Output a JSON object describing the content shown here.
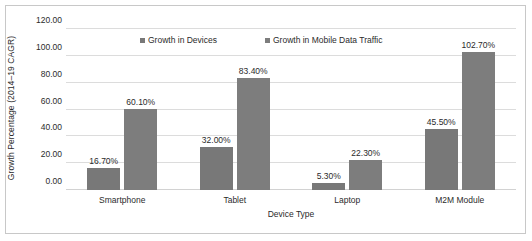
{
  "chart_data": {
    "type": "bar",
    "title": "",
    "xlabel": "Device Type",
    "ylabel": "Growth Percentage (2014–19 CAGR)",
    "categories": [
      "Smartphone",
      "Tablet",
      "Laptop",
      "M2M Module"
    ],
    "series": [
      {
        "name": "Growth in Devices",
        "color": "#787878",
        "values": [
          16.7,
          32.0,
          5.3,
          45.5
        ],
        "labels": [
          "16.70%",
          "32.00%",
          "5.30%",
          "45.50%"
        ]
      },
      {
        "name": "Growth in Mobile Data Traffic",
        "color": "#7d7d7d",
        "values": [
          60.1,
          83.4,
          22.3,
          102.7
        ],
        "labels": [
          "60.10%",
          "83.40%",
          "22.30%",
          "102.70%"
        ]
      }
    ],
    "ylim": [
      0,
      120
    ],
    "yticks": [
      0,
      20,
      40,
      60,
      80,
      100,
      120
    ],
    "ytick_labels": [
      "0.00",
      "20.00",
      "40.00",
      "60.00",
      "80.00",
      "100.00",
      "120.00"
    ],
    "grid": true,
    "legend_position": "top-center",
    "value_labels": true
  },
  "colors": {
    "bar_series_1": "#787878",
    "bar_series_2": "#7d7d7d",
    "gridline": "#dcdcdc",
    "text": "#2b2b2b",
    "border": "#c8c8c8",
    "background": "#ffffff"
  }
}
